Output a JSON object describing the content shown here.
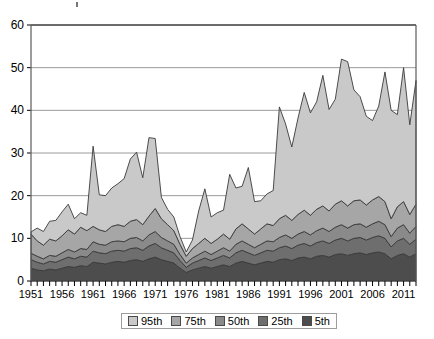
{
  "chart_data": {
    "type": "area",
    "stacked": true,
    "title": "",
    "subtitle": "",
    "xlabel": "",
    "ylabel": "",
    "xlim": [
      1951,
      2013
    ],
    "ylim": [
      0,
      60
    ],
    "yticks": [
      0,
      10,
      20,
      30,
      40,
      50,
      60
    ],
    "ytick_labels": [
      "0",
      "10",
      "20",
      "30",
      "40",
      "50",
      "60"
    ],
    "grid": "horizontal",
    "legend_position": "bottom",
    "tick_interval_years": 1,
    "label_interval_years": 5,
    "x": [
      1951,
      1952,
      1953,
      1954,
      1955,
      1956,
      1957,
      1958,
      1959,
      1960,
      1961,
      1962,
      1963,
      1964,
      1965,
      1966,
      1967,
      1968,
      1969,
      1970,
      1971,
      1972,
      1973,
      1974,
      1975,
      1976,
      1977,
      1978,
      1979,
      1980,
      1981,
      1982,
      1983,
      1984,
      1985,
      1986,
      1987,
      1988,
      1989,
      1990,
      1991,
      1992,
      1993,
      1994,
      1995,
      1996,
      1997,
      1998,
      1999,
      2000,
      2001,
      2002,
      2003,
      2004,
      2005,
      2006,
      2007,
      2008,
      2009,
      2010,
      2011,
      2012,
      2013
    ],
    "xtick_labels": [
      "1951",
      "1956",
      "1961",
      "1966",
      "1971",
      "1976",
      "1981",
      "1986",
      "1991",
      "1996",
      "2001",
      "2006",
      "2011"
    ],
    "series": [
      {
        "name": "5th",
        "color": "#4d4d4d",
        "values": [
          3.0,
          2.6,
          2.4,
          2.8,
          2.6,
          3.0,
          3.4,
          3.2,
          3.6,
          3.4,
          4.4,
          4.2,
          4.0,
          4.4,
          4.6,
          4.4,
          4.8,
          5.0,
          4.6,
          5.2,
          5.6,
          5.0,
          4.6,
          4.2,
          3.0,
          2.0,
          2.6,
          3.0,
          3.4,
          3.0,
          3.4,
          3.8,
          3.4,
          4.2,
          4.6,
          4.2,
          3.8,
          4.2,
          4.6,
          4.4,
          5.0,
          5.2,
          4.8,
          5.4,
          5.6,
          5.2,
          5.8,
          6.0,
          5.6,
          6.2,
          6.4,
          6.0,
          6.4,
          6.6,
          6.2,
          6.6,
          6.8,
          6.4,
          5.2,
          6.0,
          6.4,
          5.6,
          6.4
        ]
      },
      {
        "name": "25th",
        "color": "#6e6e6e",
        "values": [
          2.0,
          1.8,
          1.6,
          1.8,
          1.8,
          2.0,
          2.2,
          2.0,
          2.2,
          2.2,
          2.6,
          2.4,
          2.4,
          2.6,
          2.6,
          2.6,
          2.8,
          2.8,
          2.6,
          3.0,
          3.2,
          2.8,
          2.6,
          2.4,
          1.8,
          1.2,
          1.6,
          1.8,
          2.0,
          1.8,
          2.0,
          2.2,
          2.0,
          2.4,
          2.6,
          2.4,
          2.2,
          2.4,
          2.6,
          2.6,
          2.8,
          3.0,
          2.8,
          3.0,
          3.2,
          3.0,
          3.2,
          3.4,
          3.2,
          3.4,
          3.6,
          3.4,
          3.6,
          3.6,
          3.4,
          3.6,
          3.8,
          3.6,
          2.8,
          3.4,
          3.6,
          3.0,
          3.4
        ]
      },
      {
        "name": "50th",
        "color": "#8a8a8a",
        "values": [
          1.5,
          1.4,
          1.2,
          1.4,
          1.4,
          1.6,
          1.8,
          1.6,
          1.8,
          1.8,
          2.2,
          2.0,
          2.0,
          2.2,
          2.2,
          2.2,
          2.4,
          2.4,
          2.2,
          2.6,
          2.8,
          2.4,
          2.2,
          2.0,
          1.4,
          1.0,
          1.2,
          1.4,
          1.6,
          1.4,
          1.6,
          1.8,
          1.6,
          2.0,
          2.2,
          2.0,
          1.8,
          2.0,
          2.2,
          2.2,
          2.4,
          2.6,
          2.4,
          2.6,
          2.8,
          2.6,
          2.8,
          3.0,
          2.8,
          3.0,
          3.2,
          3.0,
          3.2,
          3.2,
          3.0,
          3.2,
          3.4,
          3.2,
          2.4,
          3.0,
          3.2,
          2.6,
          3.0
        ]
      },
      {
        "name": "75th",
        "color": "#a6a6a6",
        "values": [
          4.5,
          3.6,
          3.2,
          3.8,
          3.6,
          4.0,
          4.6,
          4.2,
          5.0,
          4.4,
          3.6,
          3.4,
          3.2,
          3.6,
          3.8,
          3.6,
          4.0,
          4.2,
          3.8,
          4.4,
          5.4,
          4.4,
          3.8,
          3.2,
          2.4,
          1.6,
          2.2,
          2.6,
          3.0,
          2.6,
          2.8,
          3.2,
          2.8,
          3.6,
          4.0,
          3.6,
          3.2,
          3.6,
          4.0,
          3.8,
          4.4,
          4.6,
          4.2,
          4.6,
          5.0,
          4.6,
          5.0,
          5.2,
          4.8,
          5.4,
          5.6,
          5.2,
          5.6,
          5.6,
          5.2,
          5.6,
          5.8,
          5.4,
          4.2,
          5.0,
          5.4,
          4.4,
          5.2
        ]
      },
      {
        "name": "95th",
        "color": "#c9c9c9",
        "values": [
          0.5,
          3.0,
          3.2,
          4.2,
          4.8,
          5.6,
          6.0,
          3.6,
          3.4,
          3.6,
          18.8,
          8.2,
          8.4,
          9.0,
          9.6,
          11.2,
          14.6,
          15.8,
          11.0,
          18.4,
          16.4,
          5.0,
          3.6,
          3.2,
          1.8,
          1.0,
          2.0,
          7.6,
          11.6,
          6.2,
          6.2,
          5.6,
          15.2,
          9.6,
          8.8,
          14.4,
          7.6,
          6.6,
          7.0,
          8.2,
          26.2,
          21.4,
          17.2,
          22.6,
          27.6,
          24.0,
          25.2,
          30.6,
          23.8,
          24.6,
          33.2,
          33.8,
          26.0,
          24.2,
          20.8,
          18.6,
          21.2,
          30.4,
          25.4,
          21.6,
          31.4,
          21.0,
          29.0
        ]
      }
    ]
  },
  "legend": {
    "items": [
      {
        "label": "95th",
        "color": "#c9c9c9"
      },
      {
        "label": "75th",
        "color": "#a6a6a6"
      },
      {
        "label": "50th",
        "color": "#8a8a8a"
      },
      {
        "label": "25th",
        "color": "#6e6e6e"
      },
      {
        "label": "5th",
        "color": "#4d4d4d"
      }
    ]
  }
}
